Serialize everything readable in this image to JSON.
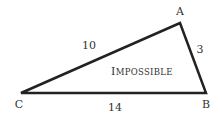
{
  "diagram": {
    "type": "triangle",
    "vertices": [
      {
        "label": "A",
        "x": 180,
        "y": 23
      },
      {
        "label": "B",
        "x": 206,
        "y": 93
      },
      {
        "label": "C",
        "x": 21,
        "y": 93
      }
    ],
    "sides": [
      {
        "between": "C-A",
        "length_label": "10"
      },
      {
        "between": "A-B",
        "length_label": "3"
      },
      {
        "between": "C-B",
        "length_label": "14"
      }
    ],
    "caption": {
      "first": "I",
      "rest": "MPOSSIBLE",
      "full": "IMPOSSIBLE"
    },
    "colors": {
      "stroke": "#222222",
      "text": "#333333",
      "background": "#ffffff"
    }
  }
}
